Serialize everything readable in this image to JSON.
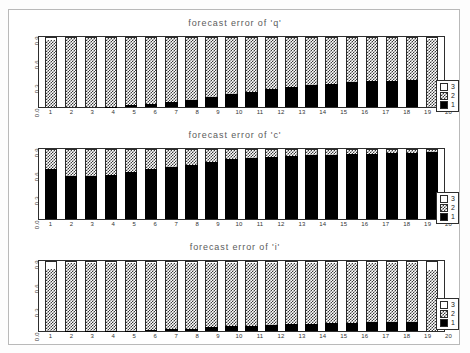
{
  "figure": {
    "background": "#ffffff",
    "frame_color": "#2e2e2e",
    "panel_count": 3
  },
  "legend": {
    "entries": [
      {
        "label": "3",
        "swatch": "white-swatch-icon",
        "color": "#ffffff"
      },
      {
        "label": "2",
        "swatch": "checker-swatch-icon",
        "color": "#3a3a3a"
      },
      {
        "label": "1",
        "swatch": "black-swatch-icon",
        "color": "#000000"
      }
    ]
  },
  "chart_data": [
    {
      "type": "bar",
      "stacked": true,
      "title": "forecast error of 'q'",
      "xlabel": "",
      "ylabel": "",
      "ylim": [
        0,
        0.9
      ],
      "yticks": [
        "0.0",
        "0.3",
        "0.6",
        "0.9"
      ],
      "grid": false,
      "legend_position": "right-bottom",
      "categories": [
        "1",
        "2",
        "3",
        "4",
        "5",
        "6",
        "7",
        "8",
        "9",
        "10",
        "11",
        "12",
        "13",
        "14",
        "15",
        "16",
        "17",
        "18",
        "19",
        "20"
      ],
      "series": [
        {
          "name": "1",
          "fill": "solid-black",
          "values": [
            0.0,
            0.0,
            0.0,
            0.005,
            0.02,
            0.04,
            0.06,
            0.09,
            0.13,
            0.17,
            0.2,
            0.23,
            0.26,
            0.28,
            0.3,
            0.32,
            0.33,
            0.34,
            0.35,
            0.0
          ]
        },
        {
          "name": "2",
          "fill": "checker",
          "values": [
            0.86,
            0.89,
            0.89,
            0.885,
            0.87,
            0.85,
            0.83,
            0.8,
            0.76,
            0.72,
            0.69,
            0.66,
            0.63,
            0.61,
            0.59,
            0.57,
            0.56,
            0.55,
            0.54,
            0.88
          ]
        },
        {
          "name": "3",
          "fill": "white",
          "values": [
            0.04,
            0.01,
            0.01,
            0.01,
            0.01,
            0.01,
            0.01,
            0.01,
            0.01,
            0.01,
            0.01,
            0.01,
            0.01,
            0.01,
            0.01,
            0.01,
            0.01,
            0.01,
            0.01,
            0.02
          ]
        }
      ]
    },
    {
      "type": "bar",
      "stacked": true,
      "title": "forecast error of 'c'",
      "xlabel": "",
      "ylabel": "",
      "ylim": [
        0,
        0.9
      ],
      "yticks": [
        "0.0",
        "0.3",
        "0.6",
        "0.9"
      ],
      "grid": false,
      "legend_position": "right-bottom",
      "categories": [
        "1",
        "2",
        "3",
        "4",
        "5",
        "6",
        "7",
        "8",
        "9",
        "10",
        "11",
        "12",
        "13",
        "14",
        "15",
        "16",
        "17",
        "18",
        "19",
        "20"
      ],
      "series": [
        {
          "name": "1",
          "fill": "solid-black",
          "values": [
            0.64,
            0.56,
            0.555,
            0.57,
            0.61,
            0.65,
            0.67,
            0.7,
            0.74,
            0.77,
            0.79,
            0.8,
            0.81,
            0.82,
            0.83,
            0.835,
            0.84,
            0.845,
            0.85,
            0.86
          ]
        },
        {
          "name": "2",
          "fill": "checker",
          "values": [
            0.25,
            0.33,
            0.335,
            0.32,
            0.28,
            0.24,
            0.22,
            0.19,
            0.15,
            0.12,
            0.1,
            0.09,
            0.08,
            0.07,
            0.06,
            0.055,
            0.05,
            0.045,
            0.04,
            0.03
          ]
        },
        {
          "name": "3",
          "fill": "white",
          "values": [
            0.01,
            0.01,
            0.01,
            0.01,
            0.01,
            0.01,
            0.01,
            0.01,
            0.01,
            0.01,
            0.01,
            0.01,
            0.01,
            0.01,
            0.01,
            0.01,
            0.01,
            0.01,
            0.01,
            0.01
          ]
        }
      ]
    },
    {
      "type": "bar",
      "stacked": true,
      "title": "forecast error of 'i'",
      "xlabel": "",
      "ylabel": "",
      "ylim": [
        0,
        0.9
      ],
      "yticks": [
        "0.0",
        "0.3",
        "0.6",
        "0.9"
      ],
      "grid": false,
      "legend_position": "right-bottom",
      "categories": [
        "1",
        "2",
        "3",
        "4",
        "5",
        "6",
        "7",
        "8",
        "9",
        "10",
        "11",
        "12",
        "13",
        "14",
        "15",
        "16",
        "17",
        "18",
        "19",
        "20"
      ],
      "series": [
        {
          "name": "1",
          "fill": "solid-black",
          "values": [
            0.0,
            0.005,
            0.005,
            0.005,
            0.005,
            0.01,
            0.02,
            0.03,
            0.05,
            0.06,
            0.07,
            0.08,
            0.09,
            0.095,
            0.1,
            0.105,
            0.11,
            0.12,
            0.12,
            0.0
          ]
        },
        {
          "name": "2",
          "fill": "checker",
          "values": [
            0.8,
            0.875,
            0.875,
            0.875,
            0.875,
            0.87,
            0.86,
            0.85,
            0.83,
            0.82,
            0.81,
            0.8,
            0.79,
            0.785,
            0.78,
            0.775,
            0.77,
            0.76,
            0.76,
            0.78
          ]
        },
        {
          "name": "3",
          "fill": "white",
          "values": [
            0.1,
            0.02,
            0.02,
            0.02,
            0.02,
            0.02,
            0.02,
            0.02,
            0.02,
            0.02,
            0.02,
            0.02,
            0.02,
            0.02,
            0.02,
            0.02,
            0.02,
            0.02,
            0.02,
            0.12
          ]
        }
      ]
    }
  ]
}
